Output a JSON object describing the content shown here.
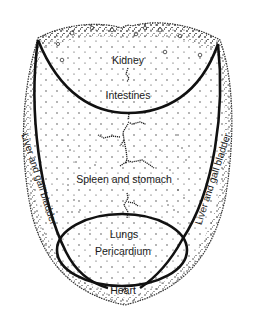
{
  "diagram": {
    "type": "tongue map",
    "colors": {
      "ink": "#111111",
      "stipple": "#222222",
      "background": "#ffffff"
    },
    "regions": {
      "tip_upper": "Kidney",
      "tip_lower": "Intestines",
      "center": "Spleen and stomach",
      "left_edge": "Liver and gall bladder",
      "right_edge": "Liver and gall bladder",
      "root_upper": "Lungs",
      "root_middle": "Pericardium",
      "root_lower": "Heart"
    }
  }
}
